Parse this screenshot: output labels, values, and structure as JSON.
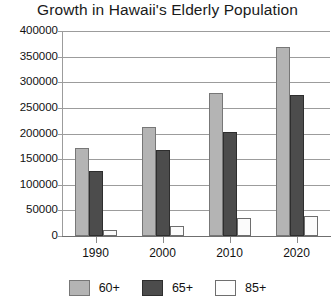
{
  "chart_data": {
    "type": "bar",
    "title": "Growth in Hawaii's Elderly Population",
    "xlabel": "",
    "ylabel": "",
    "categories": [
      "1990",
      "2000",
      "2010",
      "2020"
    ],
    "series": [
      {
        "name": "60+",
        "color": "#b4b4b4",
        "values": [
          172000,
          212000,
          279000,
          368000
        ]
      },
      {
        "name": "65+",
        "color": "#4c4c4c",
        "values": [
          127000,
          167000,
          203000,
          275000
        ]
      },
      {
        "name": "85+",
        "color": "#fbfbfb",
        "values": [
          11000,
          20000,
          35000,
          40000
        ]
      }
    ],
    "ylim": [
      0,
      400000
    ],
    "ytick_step": 50000,
    "yticks": [
      "400000",
      "350000",
      "300000",
      "250000",
      "200000",
      "150000",
      "100000",
      "50000",
      "0"
    ],
    "grid": true,
    "legend_position": "bottom"
  }
}
